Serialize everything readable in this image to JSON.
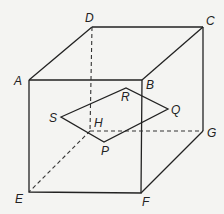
{
  "diagram": {
    "type": "cube-with-inscribed-quadrilateral",
    "vertices": {
      "A": {
        "label": "A",
        "x": 29,
        "y": 80
      },
      "B": {
        "label": "B",
        "x": 142,
        "y": 80
      },
      "C": {
        "label": "C",
        "x": 203,
        "y": 27
      },
      "D": {
        "label": "D",
        "x": 92,
        "y": 27
      },
      "E": {
        "label": "E",
        "x": 29,
        "y": 192
      },
      "F": {
        "label": "F",
        "x": 141,
        "y": 193
      },
      "G": {
        "label": "G",
        "x": 203,
        "y": 131
      },
      "H": {
        "label": "H",
        "x": 90,
        "y": 131
      }
    },
    "quad": {
      "P": {
        "label": "P",
        "x": 104,
        "y": 142
      },
      "Q": {
        "label": "Q",
        "x": 168,
        "y": 109
      },
      "R": {
        "label": "R",
        "x": 126,
        "y": 88
      },
      "S": {
        "label": "S",
        "x": 61,
        "y": 117
      }
    },
    "visible_edges": [
      "AB",
      "BF",
      "FE",
      "EA",
      "AD",
      "DC",
      "CB",
      "CG",
      "GF"
    ],
    "hidden_edges": [
      "DH",
      "HG",
      "HE"
    ],
    "quad_edges": [
      "SR",
      "RQ",
      "QP",
      "PS"
    ]
  }
}
